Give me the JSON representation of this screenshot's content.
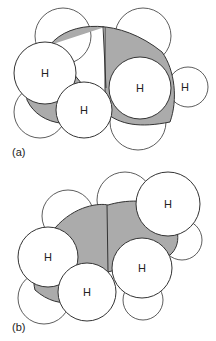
{
  "figure": {
    "colors": {
      "carbon": "#ababab",
      "hydrogen": "#ffffff",
      "stroke": "#333333",
      "text": "#222222"
    },
    "panels": [
      {
        "id": "a",
        "label": "(a)",
        "label_pos": [
          12,
          147
        ],
        "back_hydrogens": [
          {
            "cx": 63,
            "cy": 36,
            "r": 28
          },
          {
            "cx": 143,
            "cy": 36,
            "r": 28
          },
          {
            "cx": 188,
            "cy": 87,
            "r": 20
          },
          {
            "cx": 40,
            "cy": 112,
            "r": 26
          },
          {
            "cx": 138,
            "cy": 122,
            "r": 28
          }
        ],
        "carbon_path": "M50,45 C70,20 120,18 162,52 C175,70 178,100 170,122 C140,128 120,125 105,112 L105,27 M105,112 C80,130 40,128 27,100 C25,80 32,60 50,45 Z",
        "carbon_divider": "M103,26 L106,88",
        "front_hydrogens": [
          {
            "cx": 45,
            "cy": 73,
            "r": 31,
            "label": "H"
          },
          {
            "cx": 84,
            "cy": 110,
            "r": 28,
            "label": "H"
          },
          {
            "cx": 140,
            "cy": 88,
            "r": 31,
            "label": "H"
          }
        ],
        "side_label": {
          "text": "H",
          "x": 181,
          "y": 91
        }
      },
      {
        "id": "b",
        "label": "(b)",
        "label_pos": [
          12,
          322
        ],
        "back_hydrogens": [
          {
            "cx": 68,
            "cy": 216,
            "r": 26
          },
          {
            "cx": 125,
            "cy": 200,
            "r": 28
          },
          {
            "cx": 182,
            "cy": 240,
            "r": 20
          },
          {
            "cx": 44,
            "cy": 298,
            "r": 26
          },
          {
            "cx": 143,
            "cy": 300,
            "r": 20
          }
        ],
        "carbon_path": "M55,228 C75,205 100,203 108,205 C125,200 150,198 165,210 C180,225 182,245 170,255 L108,272 C90,305 60,312 35,290 C30,270 40,245 55,228 Z",
        "carbon_divider": "M107,205 L108,272",
        "front_hydrogens": [
          {
            "cx": 168,
            "cy": 204,
            "r": 32,
            "label": "H"
          },
          {
            "cx": 48,
            "cy": 257,
            "r": 30,
            "label": "H"
          },
          {
            "cx": 87,
            "cy": 292,
            "r": 29,
            "label": "H"
          },
          {
            "cx": 142,
            "cy": 268,
            "r": 30,
            "label": "H"
          }
        ]
      }
    ]
  }
}
